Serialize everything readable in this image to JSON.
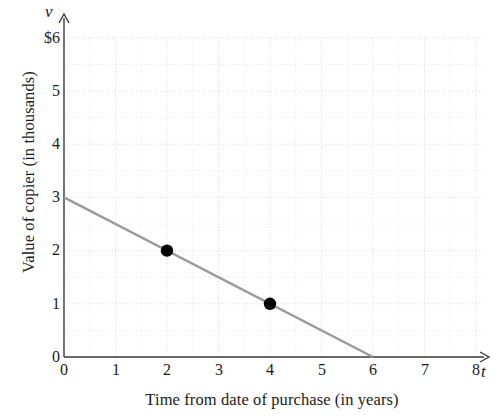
{
  "chart_data": {
    "type": "line",
    "title": "",
    "subtitle": "",
    "xlabel": "Time from date of purchase (in years)",
    "ylabel": "Value of copier (in thousands)",
    "x_variable": "t",
    "y_variable": "v",
    "xlim": [
      0,
      8
    ],
    "ylim": [
      0,
      6
    ],
    "xticks": [
      "0",
      "1",
      "2",
      "3",
      "4",
      "5",
      "6",
      "7",
      "8"
    ],
    "xtick_values": [
      0,
      1,
      2,
      3,
      4,
      5,
      6,
      7,
      8
    ],
    "yticks": [
      "0",
      "1",
      "2",
      "3",
      "4",
      "5",
      "$6"
    ],
    "ytick_values": [
      0,
      1,
      2,
      3,
      4,
      5,
      6
    ],
    "grid": true,
    "grid_style": "dotted",
    "grid_minor_step": 0.5,
    "legend": "none",
    "series": [
      {
        "name": "Value of copier",
        "type": "line",
        "color": "#9a9a9a",
        "x": [
          0,
          6
        ],
        "values": [
          3,
          0
        ],
        "slope": -0.5,
        "intercept": 3
      },
      {
        "name": "Plotted points",
        "type": "scatter",
        "color": "#000000",
        "points": [
          {
            "x": 2,
            "y": 2
          },
          {
            "x": 4,
            "y": 1
          }
        ]
      }
    ],
    "axis_arrows": [
      "x-right",
      "y-up"
    ]
  },
  "labels": {
    "ylabel": "Value of copier (in thousands)",
    "xlabel": "Time from date of purchase (in years)",
    "y_variable": "v",
    "x_variable": "t"
  }
}
